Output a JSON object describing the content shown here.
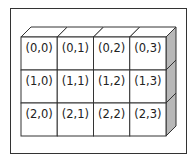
{
  "diagram": {
    "type": "3d-block-grid",
    "rows": 3,
    "cols": 4,
    "cells": [
      [
        "(0,0)",
        "(0,1)",
        "(0,2)",
        "(0,3)"
      ],
      [
        "(1,0)",
        "(1,1)",
        "(1,2)",
        "(1,3)"
      ],
      [
        "(2,0)",
        "(2,1)",
        "(2,2)",
        "(2,3)"
      ]
    ],
    "colors": {
      "face": "#ffffff",
      "side": "#b8b8b8",
      "stroke": "#333333"
    }
  }
}
